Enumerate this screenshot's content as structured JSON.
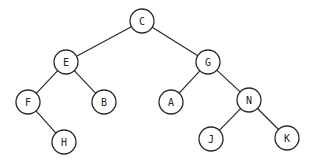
{
  "diagram": {
    "type": "binary-tree",
    "node_radius": 12,
    "colors": {
      "stroke": "#2a2a2a",
      "fill": "#ffffff",
      "text": "#222222",
      "background": "#ffffff"
    },
    "nodes": [
      {
        "id": "C",
        "label": "C",
        "x": 142,
        "y": 21
      },
      {
        "id": "E",
        "label": "E",
        "x": 66,
        "y": 62
      },
      {
        "id": "G",
        "label": "G",
        "x": 208,
        "y": 62
      },
      {
        "id": "F",
        "label": "F",
        "x": 28,
        "y": 102
      },
      {
        "id": "B",
        "label": "B",
        "x": 104,
        "y": 102
      },
      {
        "id": "A",
        "label": "A",
        "x": 171,
        "y": 102
      },
      {
        "id": "N",
        "label": "N",
        "x": 249,
        "y": 100
      },
      {
        "id": "H",
        "label": "H",
        "x": 64,
        "y": 142
      },
      {
        "id": "J",
        "label": "J",
        "x": 211,
        "y": 139
      },
      {
        "id": "K",
        "label": "K",
        "x": 287,
        "y": 138
      }
    ],
    "edges": [
      {
        "from": "C",
        "to": "E"
      },
      {
        "from": "C",
        "to": "G"
      },
      {
        "from": "E",
        "to": "F"
      },
      {
        "from": "E",
        "to": "B"
      },
      {
        "from": "G",
        "to": "A"
      },
      {
        "from": "G",
        "to": "N"
      },
      {
        "from": "F",
        "to": "H"
      },
      {
        "from": "N",
        "to": "J"
      },
      {
        "from": "N",
        "to": "K"
      }
    ]
  }
}
